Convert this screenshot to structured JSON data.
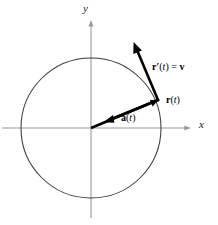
{
  "figure": {
    "background_color": "#ffffff",
    "axis_color": "#9a9a9a",
    "curve_color": "#3a3a3a",
    "vector_color": "#000000",
    "text_color": "#000000"
  },
  "axes": {
    "x_label": "x",
    "y_label": "y",
    "origin": {
      "x": 91,
      "y": 128
    },
    "x_axis": {
      "start_x": 2,
      "end_x": 193,
      "y": 128,
      "arrow": "right"
    },
    "y_axis": {
      "x": 91,
      "start_y": 218,
      "end_y": 18,
      "arrow": "up"
    }
  },
  "circle": {
    "center_x": 91,
    "center_y": 128,
    "radius": 70,
    "stroke_width": 1
  },
  "vectors": [
    {
      "name": "position",
      "label": "r(t)",
      "label_bold_part": "r",
      "label_italic_part": "t",
      "from_x": 91,
      "from_y": 128,
      "to_x": 158,
      "to_y": 100
    },
    {
      "name": "velocity",
      "label": "r'(t) = v",
      "label_bold_part": "r",
      "label_italic_part": "t",
      "from_x": 158,
      "from_y": 100,
      "to_x": 134,
      "to_y": 43
    },
    {
      "name": "acceleration",
      "label": "a(t)",
      "label_bold_part": "a",
      "label_italic_part": "t",
      "from_x": 158,
      "from_y": 100,
      "to_x": 104,
      "to_y": 122
    }
  ],
  "labels": {
    "y_axis": "y",
    "x_axis": "x",
    "velocity_prefix": "r",
    "velocity_prime": "′",
    "velocity_open": "(",
    "velocity_var": "t",
    "velocity_close": ")",
    "velocity_equals": "=",
    "velocity_value": "v",
    "position_prefix": "r",
    "position_open": "(",
    "position_var": "t",
    "position_close": ")",
    "accel_prefix": "a",
    "accel_open": "(",
    "accel_var": "t",
    "accel_close": ")"
  }
}
